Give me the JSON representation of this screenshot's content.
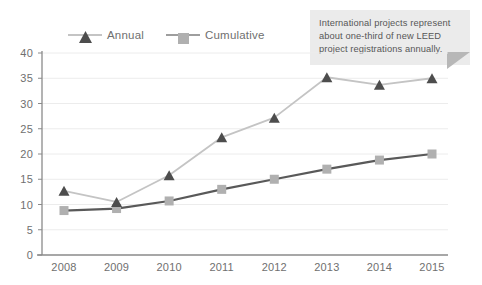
{
  "chart_data": {
    "type": "line",
    "title": "",
    "subtitle": "",
    "xlabel": "",
    "ylabel": "",
    "categories": [
      "2008",
      "2009",
      "2010",
      "2011",
      "2012",
      "2013",
      "2014",
      "2015"
    ],
    "ylim": [
      0,
      40
    ],
    "ytick_step": 5,
    "yticks": [
      "0",
      "5",
      "10",
      "15",
      "20",
      "25",
      "30",
      "35",
      "40"
    ],
    "grid": "horizontal",
    "legend_position": "top-left",
    "series": [
      {
        "name": "Annual",
        "marker": "triangle",
        "color": "#4d4d4d",
        "line_color": "#c4c4c4",
        "values": [
          12.7,
          10.5,
          15.8,
          23.3,
          27.2,
          35.2,
          33.7,
          35.0
        ]
      },
      {
        "name": "Cumulative",
        "marker": "square",
        "color": "#b0b0b0",
        "line_color": "#595959",
        "values": [
          8.8,
          9.2,
          10.7,
          13.0,
          15.0,
          17.0,
          18.8,
          20.0
        ]
      }
    ],
    "annotations": [
      {
        "name": "international-projects-callout",
        "lines": [
          "International projects represent",
          "about one-third of new LEED",
          "project registrations annually."
        ]
      }
    ]
  },
  "legend": {
    "items": [
      {
        "label": "Annual"
      },
      {
        "label": "Cumulative"
      }
    ]
  },
  "colors": {
    "annual_marker": "#4d4d4d",
    "annual_line": "#c4c4c4",
    "cumulative_marker": "#b0b0b0",
    "cumulative_line": "#595959",
    "axis": "#8a8a8a",
    "grid": "#ececec",
    "tick_label": "#6f6f6f",
    "callout_bg": "#ebebeb",
    "callout_text": "#575757",
    "callout_tail": "#b7b7b7"
  }
}
